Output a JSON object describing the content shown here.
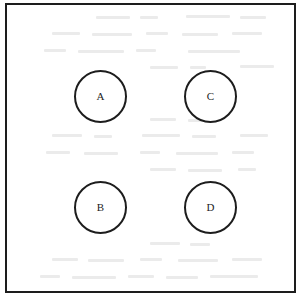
{
  "figure": {
    "type": "node-diagram",
    "background_color": "#ffffff",
    "stroke_color": "#1d1d1d",
    "frame": {
      "label": "diagram-border",
      "x": 5,
      "y": 3,
      "width": 291,
      "height": 290,
      "border_width": 2
    },
    "nodes": [
      {
        "id": "a",
        "label": "A",
        "cx": 100,
        "cy": 96,
        "diameter": 53,
        "row": "top",
        "column": "left"
      },
      {
        "id": "c",
        "label": "C",
        "cx": 210,
        "cy": 96,
        "diameter": 53,
        "row": "top",
        "column": "right"
      },
      {
        "id": "b",
        "label": "B",
        "cx": 100,
        "cy": 207,
        "diameter": 53,
        "row": "bottom",
        "column": "left"
      },
      {
        "id": "d",
        "label": "D",
        "cx": 210,
        "cy": 207,
        "diameter": 53,
        "row": "bottom",
        "column": "right"
      }
    ]
  }
}
